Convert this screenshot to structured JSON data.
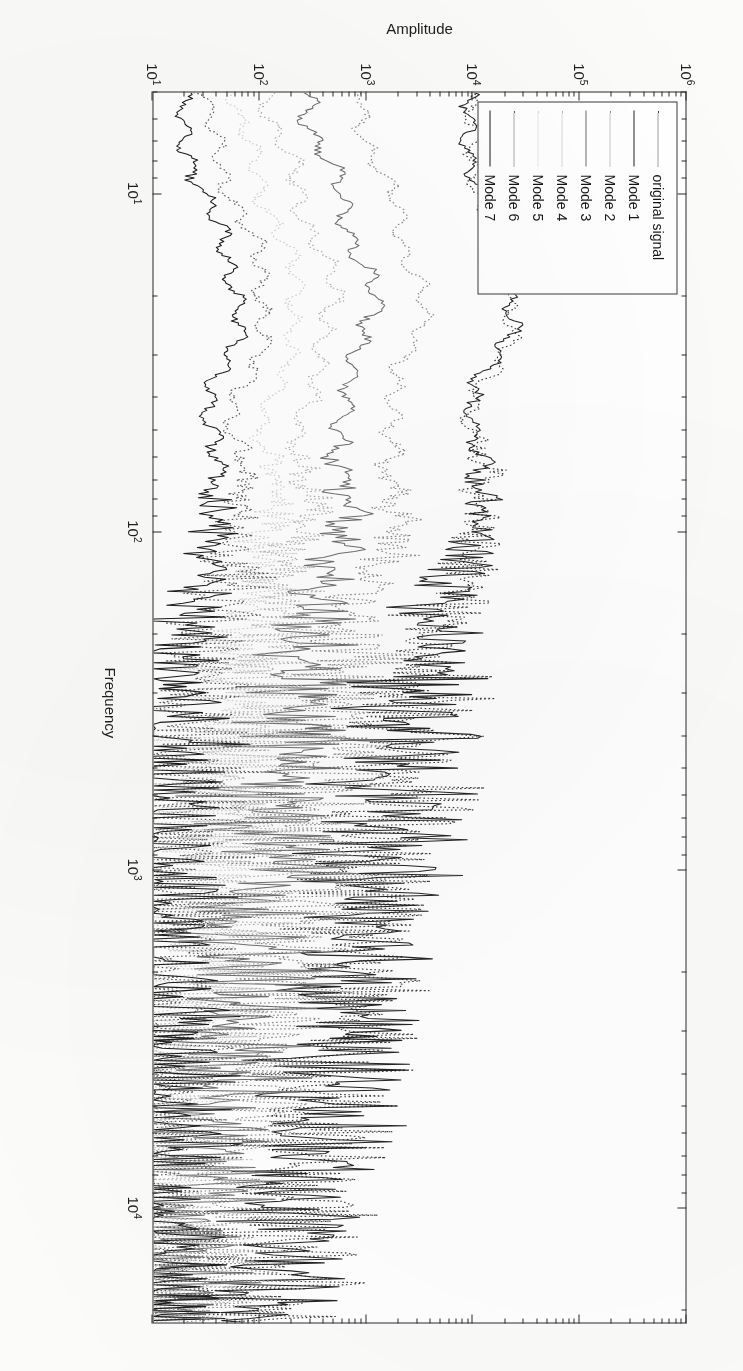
{
  "figure": {
    "background_color": "#ffffff",
    "frame_color": "#2b2b2b"
  },
  "axes": {
    "x_title": "Frequency",
    "y_title": "Amplitude",
    "x_scale": "log",
    "y_scale": "log",
    "x_tick_labels": [
      "10¹",
      "10²",
      "10³",
      "10⁴"
    ],
    "y_tick_labels": [
      "10¹",
      "10²",
      "10³",
      "10⁴",
      "10⁵",
      "10⁶"
    ]
  },
  "legend": {
    "items": [
      {
        "label": "original signal",
        "style": "dotted",
        "color": "#3d3d3d"
      },
      {
        "label": "Mode 1",
        "style": "solid",
        "color": "#242424"
      },
      {
        "label": "Mode 2",
        "style": "dotted",
        "color": "#8a8a8a"
      },
      {
        "label": "Mode 3",
        "style": "solid",
        "color": "#6f6f6f"
      },
      {
        "label": "Mode 4",
        "style": "dotted",
        "color": "#b0b0b0"
      },
      {
        "label": "Mode 5",
        "style": "dotted",
        "color": "#cfcfcf"
      },
      {
        "label": "Mode 6",
        "style": "dotted",
        "color": "#5a5a5a"
      },
      {
        "label": "Mode 7",
        "style": "solid",
        "color": "#1b1b1b"
      }
    ]
  },
  "chart_data": {
    "type": "line",
    "title": "",
    "xlabel": "Frequency",
    "ylabel": "Amplitude",
    "xscale": "log",
    "yscale": "log",
    "xlim": [
      5,
      22000
    ],
    "ylim": [
      10,
      1000000
    ],
    "xticks": [
      10,
      100,
      1000,
      10000
    ],
    "xticklabels": [
      "10¹",
      "10²",
      "10³",
      "10⁴"
    ],
    "yticks": [
      10,
      100,
      1000,
      10000,
      100000,
      1000000
    ],
    "yticklabels": [
      "10¹",
      "10²",
      "10³",
      "10⁴",
      "10⁵",
      "10⁶"
    ],
    "grid": false,
    "legend_position": "upper left",
    "x": [
      6,
      8,
      11,
      15,
      20,
      27,
      36,
      48,
      65,
      87,
      117,
      157,
      210,
      282,
      378,
      507,
      680,
      912,
      1223,
      1640,
      2200,
      2950,
      3955,
      5305,
      7115,
      9540,
      12800,
      17170,
      21000
    ],
    "series": [
      {
        "name": "original signal",
        "style": "dotted",
        "color": "#3d3d3d",
        "values": [
          9000,
          11000,
          13000,
          17000,
          24000,
          21000,
          13000,
          9500,
          12000,
          14000,
          9000,
          6000,
          4200,
          3400,
          2600,
          2100,
          1900,
          1500,
          1300,
          1100,
          900,
          700,
          520,
          380,
          300,
          230,
          170,
          120,
          90
        ]
      },
      {
        "name": "Mode 1",
        "style": "solid",
        "color": "#242424",
        "values": [
          8600,
          10400,
          12300,
          16200,
          22800,
          20000,
          12300,
          9000,
          11300,
          13200,
          8500,
          5700,
          4000,
          3200,
          2450,
          2000,
          1800,
          1430,
          1240,
          1050,
          860,
          670,
          500,
          365,
          288,
          220,
          163,
          115,
          86
        ]
      },
      {
        "name": "Mode 2",
        "style": "dotted",
        "color": "#8a8a8a",
        "values": [
          900,
          1300,
          1800,
          2600,
          3400,
          2900,
          2000,
          1500,
          1700,
          1900,
          1400,
          1000,
          760,
          620,
          500,
          420,
          380,
          310,
          270,
          230,
          195,
          155,
          120,
          92,
          74,
          58,
          44,
          33,
          25
        ]
      },
      {
        "name": "Mode 3",
        "style": "solid",
        "color": "#6f6f6f",
        "values": [
          300,
          430,
          600,
          880,
          1150,
          990,
          700,
          530,
          600,
          670,
          500,
          370,
          285,
          235,
          192,
          163,
          148,
          122,
          107,
          92,
          79,
          64,
          50,
          39,
          32,
          26,
          20,
          16,
          13
        ]
      },
      {
        "name": "Mode 4",
        "style": "dotted",
        "color": "#b0b0b0",
        "values": [
          130,
          185,
          258,
          380,
          500,
          430,
          305,
          232,
          263,
          293,
          220,
          164,
          127,
          105,
          87,
          74,
          68,
          57,
          50,
          43,
          38,
          31,
          25,
          20,
          17,
          14,
          12,
          11,
          10
        ]
      },
      {
        "name": "Mode 5",
        "style": "dotted",
        "color": "#cfcfcf",
        "values": [
          62,
          88,
          122,
          180,
          237,
          204,
          145,
          111,
          126,
          141,
          106,
          80,
          62,
          52,
          44,
          38,
          35,
          30,
          27,
          24,
          21,
          18,
          15,
          13,
          12,
          11,
          10,
          10,
          10
        ]
      },
      {
        "name": "Mode 6",
        "style": "dotted",
        "color": "#5a5a5a",
        "values": [
          31,
          44,
          61,
          90,
          119,
          103,
          74,
          57,
          65,
          73,
          55,
          42,
          33,
          28,
          24,
          21,
          20,
          17,
          16,
          15,
          14,
          13,
          12,
          11,
          11,
          10,
          10,
          10,
          10
        ]
      },
      {
        "name": "Mode 7",
        "style": "solid",
        "color": "#1b1b1b",
        "values": [
          17,
          24,
          33,
          49,
          65,
          57,
          41,
          32,
          37,
          41,
          32,
          25,
          20,
          18,
          16,
          15,
          14,
          13,
          12,
          12,
          11,
          11,
          10,
          10,
          10,
          10,
          10,
          10,
          10
        ]
      }
    ],
    "note": "Log-log amplitude spectra of an EMD decomposition; above ~2x10^2 Hz all mode spectra become dense broadband noise overlapping each other."
  }
}
